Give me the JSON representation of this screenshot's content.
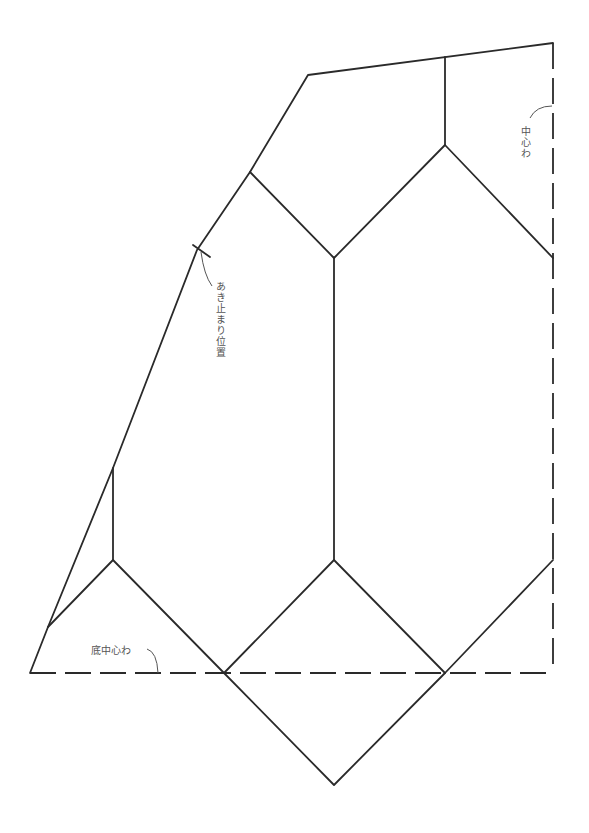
{
  "diagram": {
    "type": "sewing-pattern",
    "labels": {
      "center_fold": "中心わ",
      "opening_stop": "あき止まり位置",
      "bottom_center_fold": "底中心わ"
    },
    "line_color": "#2a2a2a",
    "text_color": "#555555"
  }
}
